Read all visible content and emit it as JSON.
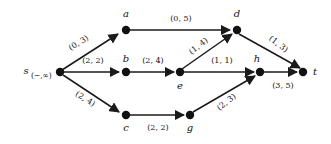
{
  "figure": {
    "type": "network-flow-graph",
    "background_color": "#ffffff",
    "ink_color": "#111111",
    "width": 331,
    "height": 144,
    "label_format": "(lower, upper)"
  },
  "nodes": [
    {
      "id": "s",
      "label": "s",
      "sublabel": "(−,∞)",
      "x": 60,
      "y": 72,
      "label_pos": "left"
    },
    {
      "id": "a",
      "label": "a",
      "sublabel": "",
      "x": 126,
      "y": 30,
      "label_pos": "above"
    },
    {
      "id": "b",
      "label": "b",
      "sublabel": "",
      "x": 126,
      "y": 72,
      "label_pos": "above"
    },
    {
      "id": "c",
      "label": "c",
      "sublabel": "",
      "x": 126,
      "y": 115,
      "label_pos": "below"
    },
    {
      "id": "d",
      "label": "d",
      "sublabel": "",
      "x": 237,
      "y": 30,
      "label_pos": "above"
    },
    {
      "id": "e",
      "label": "e",
      "sublabel": "",
      "x": 180,
      "y": 72,
      "label_pos": "below"
    },
    {
      "id": "g",
      "label": "g",
      "sublabel": "",
      "x": 190,
      "y": 115,
      "label_pos": "below"
    },
    {
      "id": "h",
      "label": "h",
      "sublabel": "",
      "x": 260,
      "y": 72,
      "label_pos": "above"
    },
    {
      "id": "t",
      "label": "t",
      "sublabel": "",
      "x": 303,
      "y": 72,
      "label_pos": "right"
    }
  ],
  "edges": [
    {
      "from": "s",
      "to": "a",
      "label": "(0, 5)_placeholder",
      "text": "(0, 3)",
      "lower": 0,
      "upper": 3,
      "lx": 80,
      "ly": 45,
      "rot": -32
    },
    {
      "from": "s",
      "to": "b",
      "text": "(2, 2)",
      "lower": 2,
      "upper": 2,
      "lx": 93,
      "ly": 62,
      "rot": 0
    },
    {
      "from": "s",
      "to": "c",
      "text": "(2, 4)",
      "lower": 2,
      "upper": 4,
      "lx": 84,
      "ly": 100,
      "rot": 32
    },
    {
      "from": "a",
      "to": "d",
      "text": "(0, 5)",
      "lower": 0,
      "upper": 5,
      "lx": 181,
      "ly": 20,
      "rot": 0
    },
    {
      "from": "b",
      "to": "e",
      "text": "(2, 4)",
      "lower": 2,
      "upper": 4,
      "lx": 153,
      "ly": 62,
      "rot": 0
    },
    {
      "from": "c",
      "to": "g",
      "text": "(2, 2)",
      "lower": 2,
      "upper": 2,
      "lx": 158,
      "ly": 128,
      "rot": 0
    },
    {
      "from": "e",
      "to": "d",
      "text": "(1, 4)",
      "lower": 1,
      "upper": 4,
      "lx": 200,
      "ly": 48,
      "rot": -38
    },
    {
      "from": "e",
      "to": "h",
      "text": "(1, 1)",
      "lower": 1,
      "upper": 1,
      "lx": 222,
      "ly": 62,
      "rot": 0
    },
    {
      "from": "g",
      "to": "h",
      "text": "(2, 3)",
      "lower": 2,
      "upper": 3,
      "lx": 228,
      "ly": 103,
      "rot": -38
    },
    {
      "from": "d",
      "to": "t",
      "text": "(1, 3)",
      "lower": 1,
      "upper": 3,
      "lx": 277,
      "ly": 45,
      "rot": 38
    },
    {
      "from": "h",
      "to": "t",
      "text": "(3, 5)",
      "lower": 3,
      "upper": 5,
      "lx": 283,
      "ly": 86,
      "rot": 0
    }
  ]
}
